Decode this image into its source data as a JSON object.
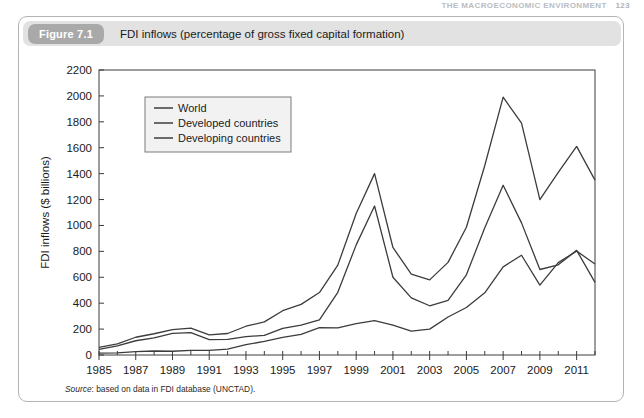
{
  "running_head": {
    "text": "THE MACROECONOMIC ENVIRONMENT",
    "page": "123"
  },
  "figure": {
    "badge": "Figure 7.1",
    "title": "FDI inflows (percentage of gross fixed capital formation)",
    "source_prefix": "Source",
    "source_text": ": based on data in FDI database (UNCTAD)."
  },
  "colors": {
    "card_border": "#b4b4b4",
    "header_bg": "#e2e2e2",
    "badge_bg": "#a9a9a9",
    "line": "#3c3c3c",
    "axis": "#3c3c3c",
    "legend_border": "#7a7a7a",
    "legend_bg": "#f2f2f2"
  },
  "chart_data": {
    "type": "line",
    "title": "FDI inflows (percentage of gross fixed capital formation)",
    "xlabel": "",
    "ylabel": "FDI inflows ($ billions)",
    "xlim": [
      1985,
      2012
    ],
    "ylim": [
      0,
      2200
    ],
    "ytick_step": 200,
    "yticks": [
      0,
      200,
      400,
      600,
      800,
      1000,
      1200,
      1400,
      1600,
      1800,
      2000,
      2200
    ],
    "xticks": [
      1985,
      1987,
      1989,
      1991,
      1993,
      1995,
      1997,
      1999,
      2001,
      2003,
      2005,
      2007,
      2009,
      2011
    ],
    "xtick_minor_step": 1,
    "grid": false,
    "legend_position": "top-left",
    "x": [
      1985,
      1986,
      1987,
      1988,
      1989,
      1990,
      1991,
      1992,
      1993,
      1994,
      1995,
      1996,
      1997,
      1998,
      1999,
      2000,
      2001,
      2002,
      2003,
      2004,
      2005,
      2006,
      2007,
      2008,
      2009,
      2010,
      2011,
      2012
    ],
    "series": [
      {
        "name": "World",
        "values": [
          58,
          86,
          137,
          164,
          196,
          207,
          155,
          166,
          222,
          256,
          342,
          391,
          482,
          694,
          1092,
          1400,
          830,
          625,
          580,
          715,
          986,
          1463,
          1990,
          1790,
          1200,
          1409,
          1610,
          1350
        ]
      },
      {
        "name": "Developed countries",
        "values": [
          44,
          70,
          110,
          132,
          167,
          172,
          119,
          120,
          142,
          151,
          206,
          231,
          271,
          484,
          850,
          1150,
          600,
          441,
          380,
          422,
          619,
          983,
          1310,
          1020,
          660,
          696,
          808,
          561
        ]
      },
      {
        "name": "Developing countries",
        "values": [
          14,
          16,
          26,
          31,
          29,
          35,
          36,
          46,
          80,
          105,
          136,
          160,
          211,
          210,
          242,
          265,
          230,
          184,
          200,
          293,
          367,
          480,
          680,
          770,
          540,
          713,
          802,
          703
        ]
      }
    ]
  }
}
